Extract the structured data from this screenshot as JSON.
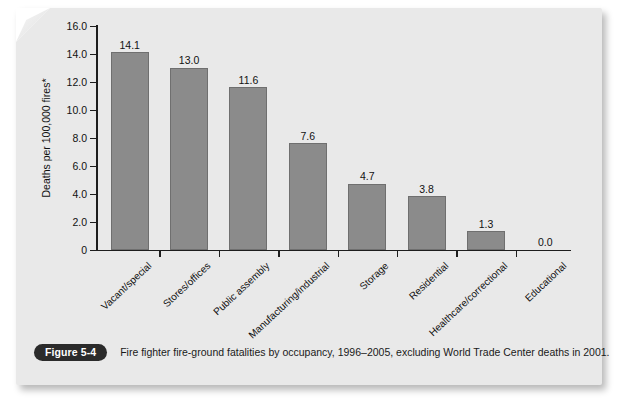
{
  "figure": {
    "badge_label": "Figure 5-4",
    "caption": "Fire fighter fire-ground fatalities by occupancy, 1996–2005, excluding World Trade Center deaths in 2001."
  },
  "chart_data": {
    "type": "bar",
    "title": "",
    "xlabel": "",
    "ylabel": "Deaths per 100,000 fires*",
    "ylim": [
      0,
      16
    ],
    "ytick_labels": [
      "0",
      "2.0",
      "4.0",
      "6.0",
      "8.0",
      "10.0",
      "12.0",
      "14.0",
      "16.0"
    ],
    "yticks": [
      0,
      2,
      4,
      6,
      8,
      10,
      12,
      14,
      16
    ],
    "grid": false,
    "legend": "none",
    "bar_color": "#8b8b8b",
    "background_color": "#e9e9e9",
    "categories": [
      "Vacant/special",
      "Stores/offices",
      "Public assembly",
      "Manufacturing/industrial",
      "Storage",
      "Residential",
      "Healthcare/correctional",
      "Educational"
    ],
    "values": [
      14.1,
      13.0,
      11.6,
      7.6,
      4.7,
      3.8,
      1.3,
      0.0
    ],
    "value_labels": [
      "14.1",
      "13.0",
      "11.6",
      "7.6",
      "4.7",
      "3.8",
      "1.3",
      "0.0"
    ]
  }
}
